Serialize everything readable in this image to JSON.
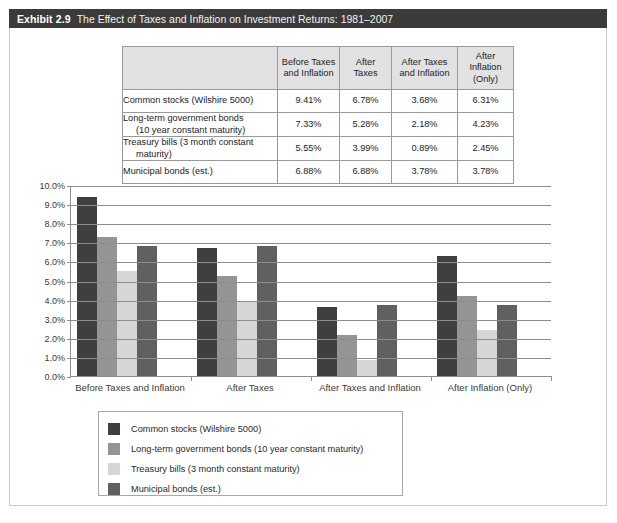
{
  "exhibit": {
    "number": "Exhibit 2.9",
    "title": "The Effect of Taxes and Inflation on Investment Returns: 1981–2007"
  },
  "table": {
    "headers": [
      "",
      "Before Taxes and Inflation",
      "After Taxes",
      "After Taxes and Inflation",
      "After Inflation (Only)"
    ],
    "header_lines": [
      [
        "",
        ""
      ],
      [
        "Before Taxes",
        "and Inflation"
      ],
      [
        "After",
        "Taxes"
      ],
      [
        "After Taxes",
        "and Inflation"
      ],
      [
        "After",
        "Inflation (Only)"
      ]
    ],
    "rows": [
      {
        "label_line1": "Common stocks (Wilshire 5000)",
        "label_line2": "",
        "values": [
          "9.41%",
          "6.78%",
          "3.68%",
          "6.31%"
        ]
      },
      {
        "label_line1": "Long-term government bonds",
        "label_line2": "(10 year constant maturity)",
        "values": [
          "7.33%",
          "5.28%",
          "2.18%",
          "4.23%"
        ]
      },
      {
        "label_line1": "Treasury bills (3 month constant",
        "label_line2": "maturity)",
        "values": [
          "5.55%",
          "3.99%",
          "0.89%",
          "2.45%"
        ]
      },
      {
        "label_line1": "Municipal bonds (est.)",
        "label_line2": "",
        "values": [
          "6.88%",
          "6.88%",
          "3.78%",
          "3.78%"
        ]
      }
    ]
  },
  "chart_data": {
    "type": "bar",
    "title": "The Effect of Taxes and Inflation on Investment Returns: 1981–2007",
    "xlabel": "",
    "ylabel": "",
    "ylim": [
      0,
      10
    ],
    "ytick_labels": [
      "10.0%",
      "9.0%",
      "8.0%",
      "7.0%",
      "6.0%",
      "5.0%",
      "4.0%",
      "3.0%",
      "2.0%",
      "1.0%",
      "0.0%"
    ],
    "ytick_values": [
      10,
      9,
      8,
      7,
      6,
      5,
      4,
      3,
      2,
      1,
      0
    ],
    "grid": true,
    "legend_position": "bottom",
    "categories": [
      "Before Taxes and Inflation",
      "After Taxes",
      "After Taxes and Inflation",
      "After Inflation (Only)"
    ],
    "series": [
      {
        "name": "Common stocks (Wilshire 5000)",
        "color": "#3f3f3f",
        "values": [
          9.41,
          6.78,
          3.68,
          6.31
        ]
      },
      {
        "name": "Long-term government bonds (10 year constant maturity)",
        "color": "#949494",
        "values": [
          7.33,
          5.28,
          2.18,
          4.23
        ]
      },
      {
        "name": "Treasury bills (3 month constant maturity)",
        "color": "#d6d6d6",
        "values": [
          5.55,
          3.99,
          0.89,
          2.45
        ]
      },
      {
        "name": "Municipal bonds (est.)",
        "color": "#606060",
        "values": [
          6.88,
          6.88,
          3.78,
          3.78
        ]
      }
    ]
  },
  "colors": {
    "header_bar": "#3b3b3b",
    "table_header_fill": "#e2e2e2",
    "grid": "#8d8d8d",
    "frame_border": "#c8c8c8"
  }
}
